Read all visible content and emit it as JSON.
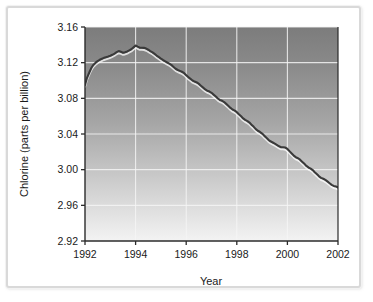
{
  "chart_data": {
    "type": "line",
    "title": "",
    "xlabel": "Year",
    "ylabel": "Chlorine (parts per billion)",
    "xlim": [
      1992,
      2002
    ],
    "ylim": [
      2.92,
      3.16
    ],
    "xticks": [
      1992,
      1994,
      1996,
      1998,
      2000,
      2002
    ],
    "xtick_labels": [
      "1992",
      "1994",
      "1996",
      "1998",
      "2000",
      "2002"
    ],
    "yticks": [
      2.92,
      2.96,
      3.0,
      3.04,
      3.08,
      3.12,
      3.16
    ],
    "ytick_labels": [
      "2.92",
      "2.96",
      "3.00",
      "3.04",
      "3.08",
      "3.12",
      "3.16"
    ],
    "grid": true,
    "grid_color": "#f0f0f0",
    "legend": "none",
    "line_color": "#3a3a3a",
    "line_width": 2,
    "plot_bg_top_color": "#808080",
    "plot_bg_bottom_color": "#f2f2f2",
    "frame_color": "#d9d9d9",
    "series": [
      {
        "name": "Chlorine",
        "x": [
          1992.0,
          1992.08,
          1992.17,
          1992.25,
          1992.33,
          1992.42,
          1992.5,
          1992.58,
          1992.67,
          1992.75,
          1992.83,
          1992.92,
          1993.0,
          1993.08,
          1993.17,
          1993.25,
          1993.33,
          1993.42,
          1993.5,
          1993.58,
          1993.67,
          1993.75,
          1993.83,
          1993.92,
          1994.0,
          1994.08,
          1994.17,
          1994.25,
          1994.33,
          1994.42,
          1994.5,
          1994.58,
          1994.67,
          1994.75,
          1994.83,
          1994.92,
          1995.0,
          1995.08,
          1995.17,
          1995.25,
          1995.33,
          1995.42,
          1995.5,
          1995.58,
          1995.67,
          1995.75,
          1995.83,
          1995.92,
          1996.0,
          1996.08,
          1996.17,
          1996.25,
          1996.33,
          1996.42,
          1996.5,
          1996.58,
          1996.67,
          1996.75,
          1996.83,
          1996.92,
          1997.0,
          1997.08,
          1997.17,
          1997.25,
          1997.33,
          1997.42,
          1997.5,
          1997.58,
          1997.67,
          1997.75,
          1997.83,
          1997.92,
          1998.0,
          1998.08,
          1998.17,
          1998.25,
          1998.33,
          1998.42,
          1998.5,
          1998.58,
          1998.67,
          1998.75,
          1998.83,
          1998.92,
          1999.0,
          1999.08,
          1999.17,
          1999.25,
          1999.33,
          1999.42,
          1999.5,
          1999.58,
          1999.67,
          1999.75,
          1999.83,
          1999.92,
          2000.0,
          2000.08,
          2000.17,
          2000.25,
          2000.33,
          2000.42,
          2000.5,
          2000.58,
          2000.67,
          2000.75,
          2000.83,
          2000.92,
          2001.0,
          2001.08,
          2001.17,
          2001.25,
          2001.33,
          2001.42,
          2001.5,
          2001.58,
          2001.67,
          2001.75,
          2001.83,
          2001.92,
          2002.0
        ],
        "y": [
          3.095,
          3.103,
          3.109,
          3.114,
          3.1175,
          3.12,
          3.1218,
          3.1232,
          3.1244,
          3.1254,
          3.1262,
          3.127,
          3.1278,
          3.1288,
          3.1302,
          3.1318,
          3.133,
          3.1322,
          3.1312,
          3.1316,
          3.1326,
          3.1338,
          3.135,
          3.1372,
          3.1392,
          3.138,
          3.1368,
          3.1368,
          3.1366,
          3.1358,
          3.1345,
          3.133,
          3.1315,
          3.1298,
          3.128,
          3.1262,
          3.1245,
          3.123,
          3.1215,
          3.1202,
          3.119,
          3.1172,
          3.1152,
          3.1132,
          3.1118,
          3.1108,
          3.1098,
          3.1082,
          3.106,
          3.1038,
          3.1018,
          3.1,
          3.0988,
          3.0978,
          3.0962,
          3.0942,
          3.092,
          3.09,
          3.0886,
          3.0876,
          3.0862,
          3.0842,
          3.082,
          3.0798,
          3.0782,
          3.0772,
          3.0758,
          3.0738,
          3.0715,
          3.0692,
          3.0675,
          3.0662,
          3.0645,
          3.0622,
          3.0598,
          3.0575,
          3.0558,
          3.0545,
          3.0528,
          3.0505,
          3.048,
          3.0455,
          3.0436,
          3.0422,
          3.0405,
          3.0382,
          3.0358,
          3.0335,
          3.0318,
          3.0305,
          3.0292,
          3.0278,
          3.0262,
          3.0252,
          3.0252,
          3.0248,
          3.0232,
          3.0208,
          3.0182,
          3.0158,
          3.014,
          3.0128,
          3.0112,
          3.009,
          3.0065,
          3.0042,
          3.0025,
          3.0012,
          2.9995,
          2.9972,
          2.9948,
          2.9925,
          2.9908,
          2.9898,
          2.9885,
          2.9868,
          2.9848,
          2.983,
          2.9818,
          2.9812,
          2.98
        ]
      }
    ]
  },
  "axis": {
    "x_title": "Year",
    "y_title": "Chlorine (parts per billion)"
  }
}
